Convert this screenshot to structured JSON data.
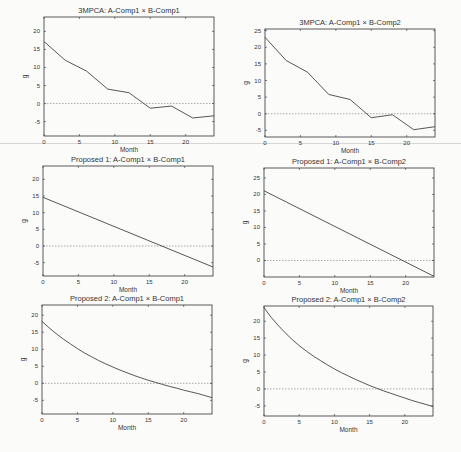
{
  "figure": {
    "width": 461,
    "height": 452,
    "line_color": "#444444",
    "axis_color": "#333333",
    "zero_line_color": "#888888"
  },
  "chart_data": [
    {
      "type": "line",
      "title": "3MPCA: A-Comp1 × B-Comp1",
      "xlabel": "Month",
      "ylabel": "g",
      "xlim": [
        0,
        24
      ],
      "ylim": [
        -9,
        24
      ],
      "xticks": [
        0,
        5,
        10,
        15,
        20
      ],
      "yticks": [
        -5,
        0,
        5,
        10,
        15,
        20
      ],
      "zero_line": true,
      "grid": false,
      "frame": {
        "x": 44,
        "y": 17,
        "w": 170,
        "h": 119
      },
      "x": [
        0,
        3,
        6,
        9,
        12,
        15,
        18,
        21,
        24
      ],
      "values": [
        17.2,
        12.0,
        9.0,
        4.0,
        3.0,
        -1.3,
        -0.7,
        -4.0,
        -3.4
      ]
    },
    {
      "type": "line",
      "title": "3MPCA: A-Comp1 × B-Comp2",
      "xlabel": "Month",
      "ylabel": "g",
      "xlim": [
        0,
        24
      ],
      "ylim": [
        -7,
        25.5
      ],
      "xticks": [
        0,
        5,
        10,
        15,
        20
      ],
      "yticks": [
        -5,
        0,
        5,
        10,
        15,
        20,
        25
      ],
      "zero_line": true,
      "grid": false,
      "frame": {
        "x": 265,
        "y": 29,
        "w": 170,
        "h": 108
      },
      "x": [
        0,
        3,
        6,
        9,
        12,
        15,
        18,
        21,
        24
      ],
      "values": [
        23.0,
        16.0,
        12.5,
        5.8,
        4.3,
        -1.2,
        -0.3,
        -4.8,
        -3.9
      ]
    },
    {
      "type": "line",
      "title": "Proposed 1: A-Comp1 × B-Comp1",
      "xlabel": "Month",
      "ylabel": "g",
      "xlim": [
        0,
        24
      ],
      "ylim": [
        -9,
        24
      ],
      "xticks": [
        0,
        5,
        10,
        15,
        20
      ],
      "yticks": [
        -5,
        0,
        5,
        10,
        15,
        20
      ],
      "zero_line": true,
      "grid": false,
      "frame": {
        "x": 43,
        "y": 166,
        "w": 170,
        "h": 110
      },
      "x": [
        0,
        24
      ],
      "values": [
        14.6,
        -6.3
      ]
    },
    {
      "type": "line",
      "title": "Proposed 1: A-Comp1 × B-Comp2",
      "xlabel": "Month",
      "ylabel": "g",
      "xlim": [
        0,
        24
      ],
      "ylim": [
        -5,
        28
      ],
      "xticks": [
        0,
        5,
        10,
        15,
        20
      ],
      "yticks": [
        0,
        5,
        10,
        15,
        20,
        25
      ],
      "zero_line": true,
      "grid": false,
      "frame": {
        "x": 264,
        "y": 168,
        "w": 170,
        "h": 109
      },
      "x": [
        0,
        24
      ],
      "values": [
        21.1,
        -4.8
      ]
    },
    {
      "type": "line",
      "title": "Proposed 2: A-Comp1 × B-Comp1",
      "xlabel": "Month",
      "ylabel": "g",
      "xlim": [
        0,
        24
      ],
      "ylim": [
        -9,
        23
      ],
      "xticks": [
        0,
        5,
        10,
        15,
        20
      ],
      "yticks": [
        -5,
        0,
        5,
        10,
        15,
        20
      ],
      "zero_line": true,
      "grid": false,
      "frame": {
        "x": 42,
        "y": 305,
        "w": 170,
        "h": 109
      },
      "x": [
        0,
        1,
        2,
        3,
        4,
        5,
        6,
        7,
        8,
        9,
        10,
        11,
        12,
        13,
        14,
        15,
        16,
        17,
        18,
        19,
        20,
        21,
        22,
        23,
        24
      ],
      "values": [
        18.2,
        16.3,
        14.6,
        13.0,
        11.6,
        10.2,
        8.9,
        7.8,
        6.7,
        5.7,
        4.8,
        3.9,
        3.1,
        2.3,
        1.6,
        0.9,
        0.3,
        -0.3,
        -0.9,
        -1.4,
        -2.0,
        -2.5,
        -3.0,
        -3.6,
        -4.2
      ]
    },
    {
      "type": "line",
      "title": "Proposed 2: A-Comp1 × B-Comp2",
      "xlabel": "Month",
      "ylabel": "g",
      "xlim": [
        0,
        24
      ],
      "ylim": [
        -8,
        24.5
      ],
      "xticks": [
        0,
        5,
        10,
        15,
        20
      ],
      "yticks": [
        -5,
        0,
        5,
        10,
        15,
        20
      ],
      "zero_line": true,
      "grid": false,
      "frame": {
        "x": 264,
        "y": 306,
        "w": 169,
        "h": 110
      },
      "x": [
        0,
        1,
        2,
        3,
        4,
        5,
        6,
        7,
        8,
        9,
        10,
        11,
        12,
        13,
        14,
        15,
        16,
        17,
        18,
        19,
        20,
        21,
        22,
        23,
        24
      ],
      "values": [
        24.0,
        21.2,
        18.8,
        16.6,
        14.6,
        12.8,
        11.2,
        9.7,
        8.4,
        7.1,
        5.9,
        4.8,
        3.8,
        2.8,
        1.9,
        1.0,
        0.2,
        -0.6,
        -1.3,
        -2.0,
        -2.7,
        -3.4,
        -4.0,
        -4.6,
        -5.2
      ]
    }
  ]
}
